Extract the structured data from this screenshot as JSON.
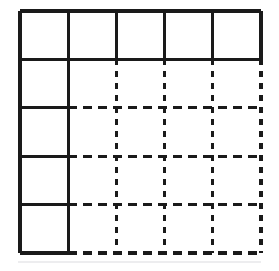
{
  "figure": {
    "kind": "grid-diagram",
    "title": "",
    "caption": "",
    "background_color": "#ffffff",
    "ink_color": "#1a1a1a"
  },
  "grid": {
    "columns": 5,
    "rows": 5,
    "origin_x": 20,
    "origin_y": 11,
    "cell_width": 48.2,
    "cell_height": 48.4,
    "x_positions": [
      20,
      68.2,
      116.4,
      164.6,
      212.8,
      261
    ],
    "y_positions": [
      11,
      59.4,
      107.8,
      156.2,
      204.6,
      253
    ],
    "solid_row_index": 0,
    "solid_column_index": 0
  },
  "stroke": {
    "solid_width": 3.2,
    "dashed_width": 3.2,
    "dash_horizontal": "9,6",
    "dash_vertical": "6,6",
    "linecap": "butt",
    "color": "#1a1a1a"
  },
  "segments": {
    "horizontal": [
      {
        "name": "h0-top-edge",
        "y_index": 0,
        "style": "solid",
        "x_from": 0,
        "x_to": 5
      },
      {
        "name": "h1-row1-bottom",
        "y_index": 1,
        "style": "solid",
        "x_from": 0,
        "x_to": 5
      },
      {
        "name": "h2-solid-part",
        "y_index": 2,
        "style": "solid",
        "x_from": 0,
        "x_to": 1
      },
      {
        "name": "h2-dashed-part",
        "y_index": 2,
        "style": "dashed",
        "x_from": 1,
        "x_to": 5
      },
      {
        "name": "h3-solid-part",
        "y_index": 3,
        "style": "solid",
        "x_from": 0,
        "x_to": 1
      },
      {
        "name": "h3-dashed-part",
        "y_index": 3,
        "style": "dashed",
        "x_from": 1,
        "x_to": 5
      },
      {
        "name": "h4-solid-part",
        "y_index": 4,
        "style": "solid",
        "x_from": 0,
        "x_to": 1
      },
      {
        "name": "h4-dashed-part",
        "y_index": 4,
        "style": "dashed",
        "x_from": 1,
        "x_to": 5
      },
      {
        "name": "h5-solid-part",
        "y_index": 5,
        "style": "solid",
        "x_from": 0,
        "x_to": 1
      },
      {
        "name": "h5-dashed-part",
        "y_index": 5,
        "style": "dashed",
        "x_from": 1,
        "x_to": 5
      }
    ],
    "vertical": [
      {
        "name": "v0-left-edge",
        "x_index": 0,
        "style": "solid",
        "y_from": 0,
        "y_to": 5
      },
      {
        "name": "v1-solid-part",
        "x_index": 1,
        "style": "solid",
        "y_from": 0,
        "y_to": 5
      },
      {
        "name": "v2-solid-part",
        "x_index": 2,
        "style": "solid",
        "y_from": 0,
        "y_to": 1
      },
      {
        "name": "v2-dashed-part",
        "x_index": 2,
        "style": "dashed",
        "y_from": 1,
        "y_to": 5
      },
      {
        "name": "v3-solid-part",
        "x_index": 3,
        "style": "solid",
        "y_from": 0,
        "y_to": 1
      },
      {
        "name": "v3-dashed-part",
        "x_index": 3,
        "style": "dashed",
        "y_from": 1,
        "y_to": 5
      },
      {
        "name": "v4-solid-part",
        "x_index": 4,
        "style": "solid",
        "y_from": 0,
        "y_to": 1
      },
      {
        "name": "v4-dashed-part",
        "x_index": 4,
        "style": "dashed",
        "y_from": 1,
        "y_to": 5
      },
      {
        "name": "v5-solid-part",
        "x_index": 5,
        "style": "solid",
        "y_from": 0,
        "y_to": 1
      },
      {
        "name": "v5-dashed-part",
        "x_index": 5,
        "style": "dashed",
        "y_from": 1,
        "y_to": 5
      }
    ]
  }
}
